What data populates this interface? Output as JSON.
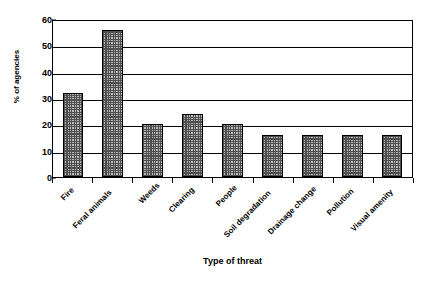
{
  "chart_data": {
    "type": "bar",
    "title": "",
    "categories": [
      "Fire",
      "Feral animals",
      "Weeds",
      "Clearing",
      "People",
      "Soil degradation",
      "Drainage change",
      "Pollution",
      "Visual amenity"
    ],
    "values": [
      32,
      56,
      20,
      24,
      20,
      16,
      16,
      16,
      16
    ],
    "xlabel": "Type of threat",
    "ylabel": "% of agencies",
    "ylim": [
      0,
      60
    ],
    "yticks": [
      0,
      10,
      20,
      30,
      40,
      50,
      60
    ],
    "ytick_labels": [
      "0",
      "10",
      "20",
      "30",
      "40",
      "50",
      "60"
    ],
    "grid": "horizontal",
    "legend": "none",
    "series": [
      {
        "name": "% of agencies",
        "values": [
          32,
          56,
          20,
          24,
          20,
          16,
          16,
          16,
          16
        ]
      }
    ],
    "bar_fill": "#b9b9b9",
    "bar_edge": "#000000",
    "axis_color": "#000000",
    "background": "#ffffff"
  }
}
